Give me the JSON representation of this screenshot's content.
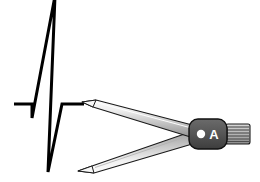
{
  "figure": {
    "background_color": "#ffffff",
    "width": 260,
    "height": 182
  },
  "ecg": {
    "name": "ecg-trace",
    "stroke_color": "#000000",
    "stroke_width": 3,
    "baseline_y": 104,
    "description": "Single QRS complex: flat baseline, small Q dip, tall R spike clipped at top, deep S trough, return to baseline",
    "points": [
      {
        "x": 14,
        "y": 104,
        "label": "isoelectric-start"
      },
      {
        "x": 32,
        "y": 104,
        "label": "q-onset"
      },
      {
        "x": 32,
        "y": 118,
        "label": "q-trough"
      },
      {
        "x": 55,
        "y": -2,
        "label": "r-peak-clipped"
      },
      {
        "x": 48,
        "y": 172,
        "label": "s-trough"
      },
      {
        "x": 62,
        "y": 104,
        "label": "j-point"
      },
      {
        "x": 84,
        "y": 104,
        "label": "isoelectric-end"
      }
    ]
  },
  "calipers": {
    "name": "ecg-calipers",
    "hinge": {
      "label": "A",
      "body_color": "#555555",
      "outline_color": "#1a1a1a",
      "pivot_dot_color": "#ffffff",
      "label_color": "#ffffff",
      "center_x": 211,
      "center_y": 134
    },
    "thumbwheel": {
      "name": "knurled-thumbwheel",
      "ridge_color": "#4d4d4d",
      "body_color": "#bfbfbf",
      "ridge_count": 7
    },
    "upper_arm": {
      "name": "upper-caliper-arm",
      "tip_x": 82,
      "tip_y": 102,
      "fill_light": "#f2f2f2",
      "fill_dark": "#8c8c8c",
      "outline_color": "#1a1a1a"
    },
    "lower_arm": {
      "name": "lower-caliper-arm",
      "tip_x": 78,
      "tip_y": 171,
      "fill_light": "#f2f2f2",
      "fill_dark": "#8c8c8c",
      "outline_color": "#1a1a1a"
    }
  }
}
